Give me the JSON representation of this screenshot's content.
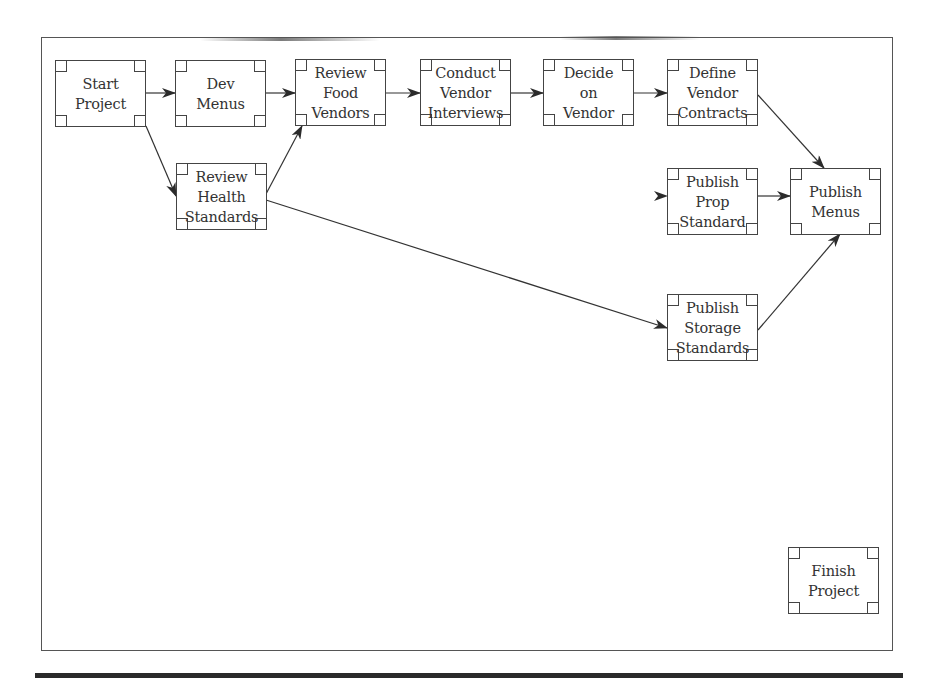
{
  "diagram": {
    "type": "network-diagram",
    "colors": {
      "line": "#333333",
      "box_border": "#444444",
      "text": "#333333",
      "frame": "#555555",
      "bottom_bar": "#2a2a2a"
    },
    "nodes": [
      {
        "id": "start",
        "label": "Start\nProject",
        "x": 55,
        "y": 60
      },
      {
        "id": "dev_menus",
        "label": "Dev\nMenus",
        "x": 175,
        "y": 60
      },
      {
        "id": "review_food",
        "label": "Review\nFood\nVendors",
        "x": 295,
        "y": 59
      },
      {
        "id": "conduct",
        "label": "Conduct\nVendor\nInterviews",
        "x": 420,
        "y": 59
      },
      {
        "id": "decide",
        "label": "Decide\non\nVendor",
        "x": 543,
        "y": 59
      },
      {
        "id": "define",
        "label": "Define\nVendor\nContracts",
        "x": 667,
        "y": 59
      },
      {
        "id": "review_health",
        "label": "Review\nHealth\nStandards",
        "x": 176,
        "y": 163
      },
      {
        "id": "publish_prop",
        "label": "Publish\nProp\nStandard",
        "x": 667,
        "y": 168
      },
      {
        "id": "publish_menus",
        "label": "Publish\nMenus",
        "x": 790,
        "y": 168
      },
      {
        "id": "publish_storage",
        "label": "Publish\nStorage\nStandards",
        "x": 667,
        "y": 294
      },
      {
        "id": "finish",
        "label": "Finish\nProject",
        "x": 788,
        "y": 547
      }
    ],
    "edges": [
      {
        "from": "start",
        "to": "dev_menus"
      },
      {
        "from": "start",
        "to": "review_health"
      },
      {
        "from": "dev_menus",
        "to": "review_food"
      },
      {
        "from": "review_health",
        "to": "review_food"
      },
      {
        "from": "review_health",
        "to": "publish_storage"
      },
      {
        "from": "review_food",
        "to": "conduct"
      },
      {
        "from": "conduct",
        "to": "decide"
      },
      {
        "from": "decide",
        "to": "define"
      },
      {
        "from": "define",
        "to": "publish_menus"
      },
      {
        "from": "(faded)",
        "to": "publish_prop"
      },
      {
        "from": "publish_prop",
        "to": "publish_menus"
      },
      {
        "from": "publish_storage",
        "to": "publish_menus"
      }
    ]
  }
}
